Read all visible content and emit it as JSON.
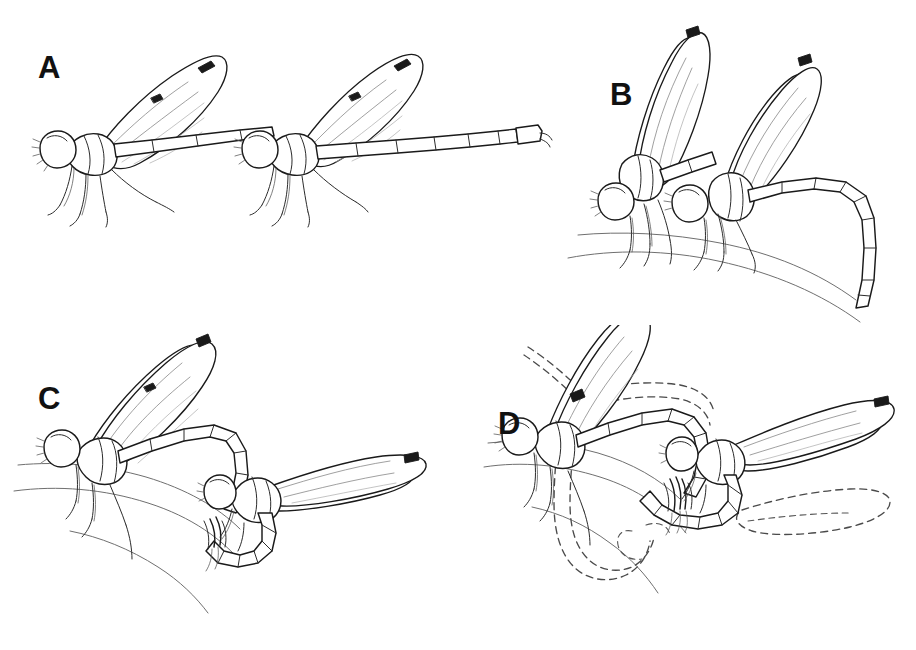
{
  "figure": {
    "kind": "scientific-line-drawing",
    "background_color": "#ffffff",
    "ink_color": "#1a1a1a",
    "substrate_color": "#6f6f6f",
    "ghost_color": "#4a4a4a",
    "width": 916,
    "height": 650
  },
  "panels": [
    {
      "id": "A",
      "label": "A",
      "label_x": 38,
      "label_y": 58,
      "stage": "tandem-linkage-in-flight",
      "description": "Two damselflies in tandem, wings raised, abdomens extended horizontally, legs dangling; left individual grasped ahead of right individual.",
      "individuals": 2,
      "substrate_visible": false,
      "dashed_overlay": false
    },
    {
      "id": "B",
      "label": "B",
      "label_x": 610,
      "label_y": 85,
      "stage": "tandem-perched",
      "description": "Tandem pair perched on a curved stem; male abdomen arched downward in a broad loop, both pairs of wings held upright.",
      "individuals": 2,
      "substrate_visible": true,
      "dashed_overlay": false
    },
    {
      "id": "C",
      "label": "C",
      "label_x": 38,
      "label_y": 383,
      "stage": "wheel-formation",
      "description": "Mating wheel: the female curls her abdomen forward to contact the male's secondary genitalia while both perch on a stem.",
      "individuals": 2,
      "substrate_visible": true,
      "dashed_overlay": false
    },
    {
      "id": "D",
      "label": "D",
      "label_x": 498,
      "label_y": 408,
      "stage": "wheel-formation-with-previous-position",
      "description": "Mating wheel with dashed outlines marking the earlier position of the female's wings and abdomen before the wheel closed.",
      "individuals": 2,
      "substrate_visible": true,
      "dashed_overlay": true
    }
  ]
}
